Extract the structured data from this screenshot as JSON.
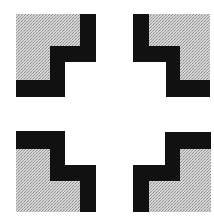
{
  "figure": {
    "description": "Four staircase-shaped corner marks arranged in a square, each with a stippled gray fill and a thick black stepped border",
    "colors": {
      "background": "#ffffff",
      "black": "#111111",
      "gray_light": "#d6d6d6",
      "gray_dark": "#9a9a9a"
    },
    "marks": [
      {
        "id": "top-left",
        "label": "Top-left corner mark"
      },
      {
        "id": "top-right",
        "label": "Top-right corner mark"
      },
      {
        "id": "bottom-left",
        "label": "Bottom-left corner mark"
      },
      {
        "id": "bottom-right",
        "label": "Bottom-right corner mark"
      }
    ]
  }
}
